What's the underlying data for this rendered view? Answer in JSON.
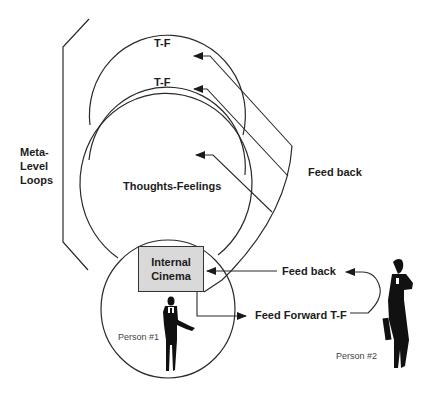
{
  "diagram": {
    "meta_label": {
      "line1": "Meta-",
      "line2": "Level",
      "line3": "Loops"
    },
    "loops": [
      {
        "label": "T-F"
      },
      {
        "label": "T-F"
      },
      {
        "label": "Thoughts-Feelings"
      }
    ],
    "internal_cinema": {
      "line1": "Internal",
      "line2": "Cinema"
    },
    "feedback_upper": "Feed back",
    "feedback_lower": "Feed back",
    "feed_forward": "Feed Forward T-F",
    "person1": "Person #1",
    "person2": "Person #2",
    "colors": {
      "stroke": "#2a2a2a",
      "box_fill": "#d9d9d9",
      "figure": "#111111"
    }
  }
}
